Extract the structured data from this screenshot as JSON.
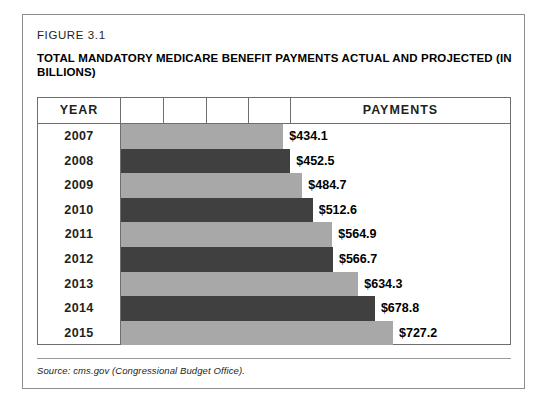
{
  "figure": {
    "label": "FIGURE 3.1",
    "title": "TOTAL MANDATORY MEDICARE BENEFIT PAYMENTS ACTUAL AND PROJECTED (IN BILLIONS)",
    "source": "Source: cms.gov (Congressional Budget Office)."
  },
  "table": {
    "headers": {
      "year": "YEAR",
      "payments": "PAYMENTS"
    }
  },
  "colors": {
    "bar_light": "#a8a8a8",
    "bar_dark": "#404040",
    "border": "#6e6e6e",
    "frame": "#8c8c8c",
    "text": "#231f20"
  },
  "chart_data": {
    "type": "bar",
    "title": "TOTAL MANDATORY MEDICARE BENEFIT PAYMENTS ACTUAL AND PROJECTED (IN BILLIONS)",
    "subtitle": "FIGURE 3.1",
    "orientation": "horizontal",
    "xlabel": "PAYMENTS",
    "ylabel": "YEAR",
    "units": "billions of US dollars",
    "grid": false,
    "legend": "none",
    "xlim": [
      0,
      800
    ],
    "categories": [
      "2007",
      "2008",
      "2009",
      "2010",
      "2011",
      "2012",
      "2013",
      "2014",
      "2015"
    ],
    "values": [
      434.1,
      452.5,
      484.7,
      512.6,
      564.9,
      566.7,
      634.3,
      678.8,
      727.2
    ],
    "value_labels": [
      "$434.1",
      "$452.5",
      "$484.7",
      "$512.6",
      "$564.9",
      "$566.7",
      "$634.3",
      "$678.8",
      "$727.2"
    ],
    "bar_colors": [
      "#a8a8a8",
      "#404040",
      "#a8a8a8",
      "#404040",
      "#a8a8a8",
      "#404040",
      "#a8a8a8",
      "#404040",
      "#a8a8a8"
    ],
    "source": "Source: cms.gov (Congressional Budget Office).",
    "rows": [
      {
        "year": "2007",
        "value": 434.1,
        "label": "$434.1",
        "shade": "light"
      },
      {
        "year": "2008",
        "value": 452.5,
        "label": "$452.5",
        "shade": "dark"
      },
      {
        "year": "2009",
        "value": 484.7,
        "label": "$484.7",
        "shade": "light"
      },
      {
        "year": "2010",
        "value": 512.6,
        "label": "$512.6",
        "shade": "dark"
      },
      {
        "year": "2011",
        "value": 564.9,
        "label": "$564.9",
        "shade": "light"
      },
      {
        "year": "2012",
        "value": 566.7,
        "label": "$566.7",
        "shade": "dark"
      },
      {
        "year": "2013",
        "value": 634.3,
        "label": "$634.3",
        "shade": "light"
      },
      {
        "year": "2014",
        "value": 678.8,
        "label": "$678.8",
        "shade": "dark"
      },
      {
        "year": "2015",
        "value": 727.2,
        "label": "$727.2",
        "shade": "light"
      }
    ]
  }
}
